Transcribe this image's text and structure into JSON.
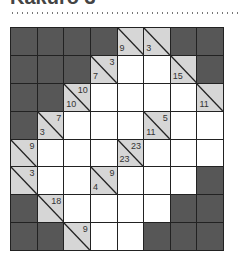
{
  "title": "Kakuro 3",
  "colors": {
    "black_cell": "#575757",
    "clue_cell": "#d6d6d6",
    "white_cell": "#ffffff",
    "grid_line": "#222222"
  },
  "grid": {
    "rows": 8,
    "cols": 8,
    "cells": [
      [
        {
          "t": "b"
        },
        {
          "t": "b"
        },
        {
          "t": "b"
        },
        {
          "t": "b"
        },
        {
          "t": "c",
          "down": "9"
        },
        {
          "t": "c",
          "down": "3"
        },
        {
          "t": "b"
        },
        {
          "t": "b"
        }
      ],
      [
        {
          "t": "b"
        },
        {
          "t": "b"
        },
        {
          "t": "b"
        },
        {
          "t": "c",
          "across": "3",
          "down": "7"
        },
        {
          "t": "w",
          "value": ""
        },
        {
          "t": "w",
          "value": ""
        },
        {
          "t": "c",
          "down": "15"
        },
        {
          "t": "b"
        }
      ],
      [
        {
          "t": "b"
        },
        {
          "t": "b"
        },
        {
          "t": "c",
          "across": "10",
          "down": "10"
        },
        {
          "t": "w",
          "value": ""
        },
        {
          "t": "w",
          "value": ""
        },
        {
          "t": "w",
          "value": ""
        },
        {
          "t": "w",
          "value": ""
        },
        {
          "t": "c",
          "down": "11"
        }
      ],
      [
        {
          "t": "b"
        },
        {
          "t": "c",
          "across": "7",
          "down": "3"
        },
        {
          "t": "w",
          "value": ""
        },
        {
          "t": "w",
          "value": ""
        },
        {
          "t": "w",
          "value": ""
        },
        {
          "t": "c",
          "across": "5",
          "down": "11"
        },
        {
          "t": "w",
          "value": ""
        },
        {
          "t": "w",
          "value": ""
        }
      ],
      [
        {
          "t": "c",
          "across": "9"
        },
        {
          "t": "w",
          "value": ""
        },
        {
          "t": "w",
          "value": ""
        },
        {
          "t": "w",
          "value": ""
        },
        {
          "t": "c",
          "across": "23",
          "down": "23"
        },
        {
          "t": "w",
          "value": ""
        },
        {
          "t": "w",
          "value": ""
        },
        {
          "t": "w",
          "value": ""
        }
      ],
      [
        {
          "t": "c",
          "across": "3"
        },
        {
          "t": "w",
          "value": ""
        },
        {
          "t": "w",
          "value": ""
        },
        {
          "t": "c",
          "across": "9",
          "down": "4"
        },
        {
          "t": "w",
          "value": ""
        },
        {
          "t": "w",
          "value": ""
        },
        {
          "t": "w",
          "value": ""
        },
        {
          "t": "b"
        }
      ],
      [
        {
          "t": "b"
        },
        {
          "t": "c",
          "across": "18"
        },
        {
          "t": "w",
          "value": ""
        },
        {
          "t": "w",
          "value": ""
        },
        {
          "t": "w",
          "value": ""
        },
        {
          "t": "w",
          "value": ""
        },
        {
          "t": "b"
        },
        {
          "t": "b"
        }
      ],
      [
        {
          "t": "b"
        },
        {
          "t": "b"
        },
        {
          "t": "c",
          "across": "9"
        },
        {
          "t": "w",
          "value": ""
        },
        {
          "t": "w",
          "value": ""
        },
        {
          "t": "b"
        },
        {
          "t": "b"
        },
        {
          "t": "b"
        }
      ]
    ]
  }
}
